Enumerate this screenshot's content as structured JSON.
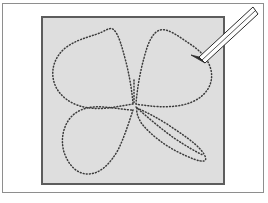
{
  "figure": {
    "background_color": "#ffffff",
    "outer_frame": {
      "name": "outer-frame",
      "border_color": "#8e8e8e",
      "x": 2,
      "y": 3,
      "width": 262,
      "height": 190
    },
    "canvas_panel": {
      "name": "drawing-canvas",
      "fill_color": "#dedede",
      "border_color": "#5d5d5d",
      "x": 41,
      "y": 16,
      "width": 184,
      "height": 169
    },
    "stroke": {
      "dot_color": "#3a3a3a",
      "style": "dotted",
      "dash_pattern": "0.9 2.2",
      "width": 1.5
    },
    "shapes": [
      {
        "name": "petal-top-left",
        "label": "Upper left leaf"
      },
      {
        "name": "petal-top-right",
        "label": "Upper right leaf"
      },
      {
        "name": "petal-bottom-left",
        "label": "Lower left leaf"
      },
      {
        "name": "petal-bottom-right",
        "label": "Lower right leaf"
      },
      {
        "name": "stem",
        "label": "Stem"
      }
    ],
    "pointer": {
      "name": "pencil-pointer",
      "label": "Pencil",
      "body_color": "#fdfdfd",
      "outline_color": "#2a2a2a",
      "tip_color": "#2e2e2e",
      "tip_x": 191,
      "tip_y": 55,
      "tail_x": 257,
      "tail_y": 11,
      "points_at": "petal-top-right"
    }
  }
}
